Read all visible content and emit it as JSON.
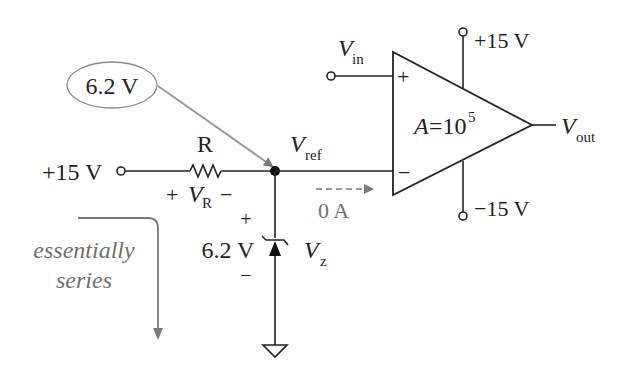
{
  "diagram": {
    "type": "voltage-comparator-with-zener-reference",
    "callout": {
      "label": "6.2 V"
    },
    "source": {
      "label": "+15 V"
    },
    "resistor": {
      "label": "R",
      "voltage_sym": "V",
      "voltage_sub": "R",
      "plus": "+",
      "minus": "−"
    },
    "node": {
      "sym": "V",
      "sub": "ref"
    },
    "current": {
      "label": "0 A"
    },
    "zener": {
      "voltage": "6.2 V",
      "sym": "V",
      "sub": "z",
      "plus": "+",
      "minus": "−"
    },
    "annotation": {
      "line1": "essentially",
      "line2": "series"
    },
    "opamp": {
      "gain_sym": "A",
      "gain_eq": "=10",
      "gain_exp": "5",
      "plus_input": "+",
      "minus_input": "−",
      "input_sym": "V",
      "input_sub": "in",
      "output_sym": "V",
      "output_sub": "out",
      "supply_pos": "+15 V",
      "supply_neg": "−15 V"
    },
    "colors": {
      "wire": "#222222",
      "annotation": "#6f6f6f",
      "callout_border": "#8a8a8a"
    }
  }
}
